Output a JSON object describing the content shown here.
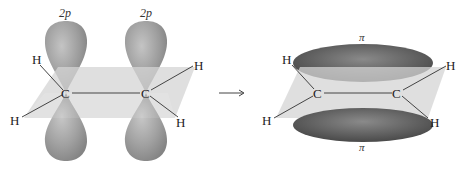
{
  "figure": {
    "left_panel": {
      "orbital_labels": [
        "2p",
        "2p"
      ],
      "atoms": {
        "carbon": [
          "C",
          "C"
        ],
        "hydrogen": [
          "H",
          "H",
          "H",
          "H"
        ]
      }
    },
    "arrow": "⟶",
    "right_panel": {
      "bond_labels": [
        "π",
        "π"
      ],
      "atoms": {
        "carbon": [
          "C",
          "C"
        ],
        "hydrogen": [
          "H",
          "H",
          "H",
          "H"
        ]
      }
    },
    "colors": {
      "p_orbital": "#9a9a9a",
      "pi_orbital": "#5e5e5e",
      "plane": "#d4d4d4",
      "bond_line": "#444444"
    }
  }
}
